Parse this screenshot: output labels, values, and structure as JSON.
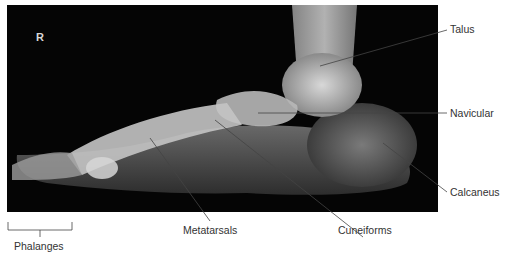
{
  "figure": {
    "side_marker": "R",
    "labels": {
      "talus": "Talus",
      "navicular": "Navicular",
      "calcaneus": "Calcaneus",
      "cuneiforms": "Cuneiforms",
      "metatarsals": "Metatarsals",
      "phalanges": "Phalanges"
    }
  }
}
